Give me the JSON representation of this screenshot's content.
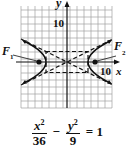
{
  "graph": {
    "x_axis_label": "x",
    "y_axis_label": "y",
    "x_tick_label": "10",
    "y_tick_label": "10",
    "focus_left_label": "F",
    "focus_left_sub": "1",
    "focus_right_label": "F",
    "focus_right_sub": "2",
    "grid_step_units": 2,
    "x_range": [
      -13,
      13
    ],
    "y_range": [
      -13,
      13
    ],
    "a": 6,
    "b": 3,
    "c": 6.7,
    "asymptotes": [
      "y = x/2",
      "y = -x/2"
    ],
    "colors": {
      "curve": "#111111",
      "grid": "#9a9a9a",
      "background": "#ffffff"
    }
  },
  "equation": {
    "x_num": "x",
    "x_den": "36",
    "minus": "−",
    "y_num": "y",
    "y_den": "9",
    "equals": "= 1",
    "exp": "2"
  }
}
